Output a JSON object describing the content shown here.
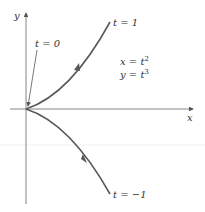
{
  "figure": {
    "axis_x_label": "x",
    "axis_y_label": "y",
    "label_t0": "t = 0",
    "label_t1": "t = 1",
    "label_tm1": "t = −1",
    "eq_x": "x = t",
    "eq_y": "y = t",
    "eq_x_exp": "2",
    "eq_y_exp": "3"
  },
  "colors": {
    "curve": "#5a5a5a",
    "axes": "#555555",
    "grid_line": "#eeeeee",
    "text": "#333333"
  }
}
